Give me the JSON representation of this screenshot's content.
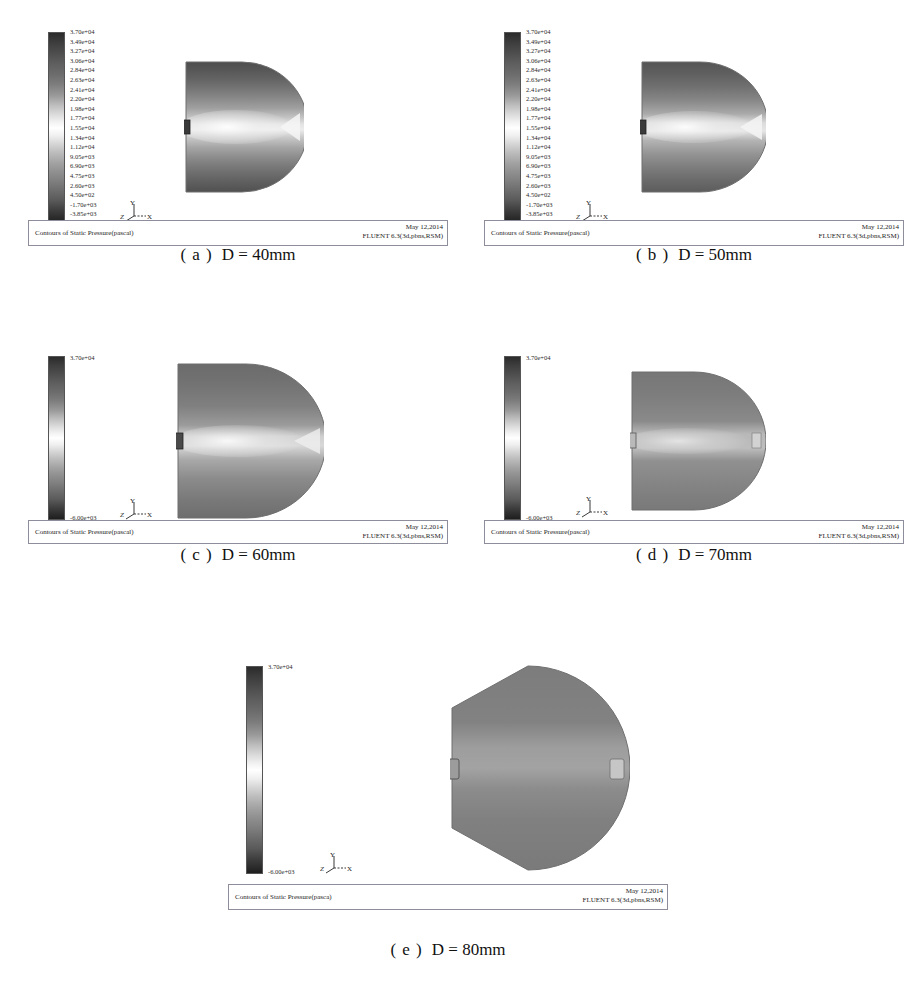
{
  "page": {
    "clipped_header_text": "",
    "background": "#ffffff"
  },
  "legend": {
    "full_labels": [
      "3.70e+04",
      "3.49e+04",
      "3.27e+04",
      "3.06e+04",
      "2.84e+04",
      "2.63e+04",
      "2.41e+04",
      "2.20e+04",
      "1.98e+04",
      "1.77e+04",
      "1.55e+04",
      "1.34e+04",
      "1.12e+04",
      "9.05e+03",
      "6.90e+03",
      "4.75e+03",
      "2.60e+03",
      "4.50e+02",
      "-1.70e+03",
      "-3.85e+03",
      "-6.00e+03"
    ],
    "max_label": "3.70e+04",
    "min_label": "-6.00e+03",
    "colormap": "grayscale",
    "units": "pascal"
  },
  "axes_triad": {
    "y_label": "Y",
    "x_label": "X",
    "z_label": "Z"
  },
  "panels": [
    {
      "id": "a",
      "caption_index": "( a )",
      "caption_value": "D = 40mm",
      "footer_title": "Contours of Static Pressure(pascal)",
      "footer_date": "May 12,2014",
      "footer_solver": "FLUENT 6.3(3d,pbns,RSM)",
      "legend_mode": "full"
    },
    {
      "id": "b",
      "caption_index": "( b )",
      "caption_value": "D = 50mm",
      "footer_title": "Contours of Static Pressure(pascal)",
      "footer_date": "May 12,2014",
      "footer_solver": "FLUENT 6.3(3d,pbns,RSM)",
      "legend_mode": "full"
    },
    {
      "id": "c",
      "caption_index": "( c )",
      "caption_value": "D = 60mm",
      "footer_title": "Contours of Static Pressure(pascal)",
      "footer_date": "May 12,2014",
      "footer_solver": "FLUENT 6.3(3d,pbns,RSM)",
      "legend_mode": "endpoints"
    },
    {
      "id": "d",
      "caption_index": "( d )",
      "caption_value": "D = 70mm",
      "footer_title": "Contours of Static Pressure(pascal)",
      "footer_date": "May 12,2014",
      "footer_solver": "FLUENT 6.3(3d,pbns,RSM)",
      "legend_mode": "endpoints"
    },
    {
      "id": "e",
      "caption_index": "( e )",
      "caption_value": "D = 80mm",
      "footer_title": "Contours of Static Pressure(pasca)",
      "footer_date": "May 12,2014",
      "footer_solver": "FLUENT 6.3(3d,pbns,RSM)",
      "legend_mode": "endpoints"
    }
  ],
  "chart_data": {
    "type": "heatmap",
    "subtitle": "Effect of nozzle diameter D on static-pressure field",
    "colormap": "grayscale",
    "colorbar": {
      "label": "Static Pressure (pascal)",
      "min": -6000,
      "max": 37000,
      "tick_values": [
        37000,
        34900,
        32700,
        30600,
        28400,
        26300,
        24100,
        22000,
        19800,
        17700,
        15500,
        13400,
        11200,
        9050,
        6900,
        4750,
        2600,
        450,
        -1700,
        -3850,
        -6000
      ],
      "tick_labels": [
        "3.70e+04",
        "3.49e+04",
        "3.27e+04",
        "3.06e+04",
        "2.84e+04",
        "2.63e+04",
        "2.41e+04",
        "2.20e+04",
        "1.98e+04",
        "1.77e+04",
        "1.55e+04",
        "1.34e+04",
        "1.12e+04",
        "9.05e+03",
        "6.90e+03",
        "4.75e+03",
        "2.60e+03",
        "4.50e+02",
        "-1.70e+03",
        "-3.85e+03",
        "-6.00e+03"
      ]
    },
    "subplots": [
      {
        "label": "( a )  D = 40mm",
        "D_mm": 40,
        "bands_top_to_bottom": [
          {
            "y_frac": 0.0,
            "value": 2600
          },
          {
            "y_frac": 0.1,
            "value": 4750
          },
          {
            "y_frac": 0.2,
            "value": 9050
          },
          {
            "y_frac": 0.3,
            "value": 13400
          },
          {
            "y_frac": 0.4,
            "value": 19800
          },
          {
            "y_frac": 0.5,
            "value": 30600
          },
          {
            "y_frac": 0.6,
            "value": 19800
          },
          {
            "y_frac": 0.7,
            "value": 13400
          },
          {
            "y_frac": 0.8,
            "value": 9050
          },
          {
            "y_frac": 0.9,
            "value": 4750
          },
          {
            "y_frac": 1.0,
            "value": 2600
          }
        ],
        "centerline_peak": 37000,
        "outlet_jet_visible": true
      },
      {
        "label": "( b )  D = 50mm",
        "D_mm": 50,
        "bands_top_to_bottom": [
          {
            "y_frac": 0.0,
            "value": 2600
          },
          {
            "y_frac": 0.12,
            "value": 6900
          },
          {
            "y_frac": 0.25,
            "value": 11200
          },
          {
            "y_frac": 0.38,
            "value": 17700
          },
          {
            "y_frac": 0.5,
            "value": 30600
          },
          {
            "y_frac": 0.62,
            "value": 17700
          },
          {
            "y_frac": 0.75,
            "value": 11200
          },
          {
            "y_frac": 0.88,
            "value": 6900
          },
          {
            "y_frac": 1.0,
            "value": 2600
          }
        ],
        "centerline_peak": 37000,
        "outlet_jet_visible": true
      },
      {
        "label": "( c )  D = 60mm",
        "D_mm": 60,
        "bands_top_to_bottom": [
          {
            "y_frac": 0.0,
            "value": 4750
          },
          {
            "y_frac": 0.18,
            "value": 11200
          },
          {
            "y_frac": 0.36,
            "value": 17700
          },
          {
            "y_frac": 0.5,
            "value": 28400
          },
          {
            "y_frac": 0.64,
            "value": 17700
          },
          {
            "y_frac": 0.82,
            "value": 11200
          },
          {
            "y_frac": 1.0,
            "value": 4750
          }
        ],
        "centerline_peak": 37000,
        "outlet_jet_visible": true
      },
      {
        "label": "( d )  D = 70mm",
        "D_mm": 70,
        "bands_top_to_bottom": [
          {
            "y_frac": 0.0,
            "value": 6900
          },
          {
            "y_frac": 0.25,
            "value": 13400
          },
          {
            "y_frac": 0.5,
            "value": 26300
          },
          {
            "y_frac": 0.75,
            "value": 13400
          },
          {
            "y_frac": 1.0,
            "value": 6900
          }
        ],
        "centerline_peak": 32700,
        "outlet_jet_visible": true
      },
      {
        "label": "( e )  D = 80mm",
        "D_mm": 80,
        "bands_top_to_bottom": [
          {
            "y_frac": 0.0,
            "value": 9050
          },
          {
            "y_frac": 0.3,
            "value": 15500
          },
          {
            "y_frac": 0.5,
            "value": 24100
          },
          {
            "y_frac": 0.7,
            "value": 15500
          },
          {
            "y_frac": 1.0,
            "value": 9050
          }
        ],
        "centerline_peak": 30600,
        "outlet_jet_visible": true
      }
    ]
  }
}
